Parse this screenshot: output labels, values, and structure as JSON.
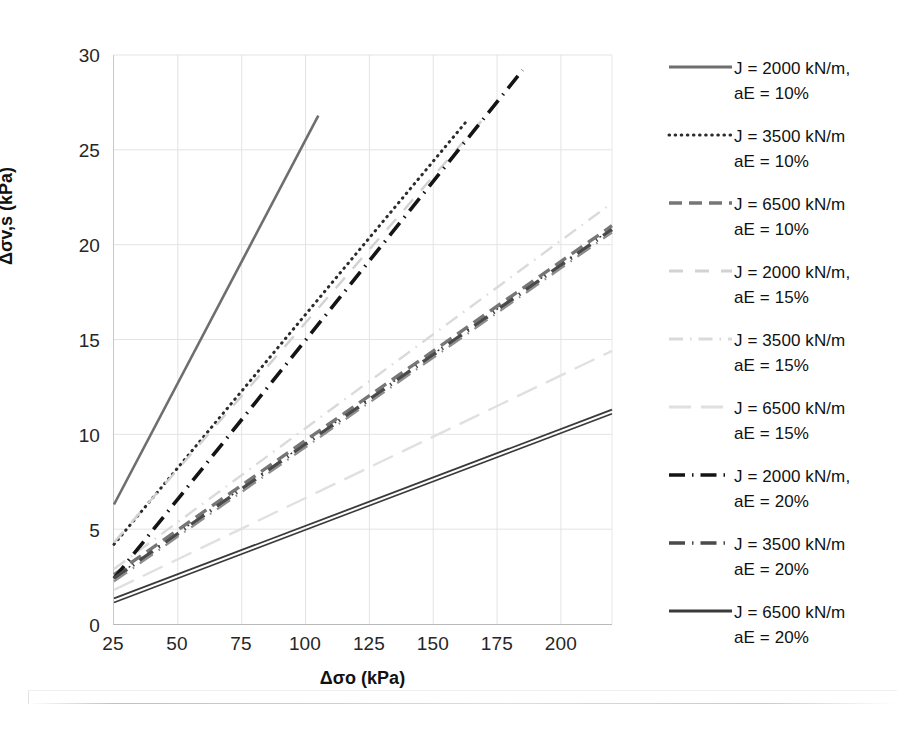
{
  "chart_data": {
    "type": "line",
    "title": "",
    "xlabel": "Δσo (kPa)",
    "ylabel": "Δσv,s (kPa)",
    "xlim": [
      25,
      220
    ],
    "ylim": [
      0,
      30
    ],
    "xticks": [
      25,
      50,
      75,
      100,
      125,
      150,
      175,
      200
    ],
    "yticks": [
      0,
      5,
      10,
      15,
      20,
      25,
      30
    ],
    "grid": true,
    "grid_color": "#e3e3e3",
    "legend_position": "right",
    "series": [
      {
        "name": "J = 2000 kN/m,\naE = 10%",
        "J": 2000,
        "aE": "10%",
        "style": "solid",
        "color": "#6e6e6e",
        "width": 2.6,
        "x": [
          25,
          105
        ],
        "y": [
          6.3,
          26.8
        ]
      },
      {
        "name": "J = 3500 kN/m\naE = 10%",
        "J": 3500,
        "aE": "10%",
        "style": "dotted",
        "color": "#2b2b2b",
        "width": 3.0,
        "x": [
          25,
          163
        ],
        "y": [
          4.2,
          26.5
        ]
      },
      {
        "name": "J = 6500 kN/m\naE = 10%",
        "J": 6500,
        "aE": "10%",
        "style": "dashed",
        "color": "#767676",
        "width": 3.4,
        "x": [
          25,
          220
        ],
        "y": [
          2.6,
          21.0
        ]
      },
      {
        "name": "J = 2000 kN/m,\naE = 15%",
        "J": 2000,
        "aE": "15%",
        "style": "dashed-light",
        "color": "#d2d2d2",
        "width": 2.4,
        "x": [
          25,
          172
        ],
        "y": [
          4.3,
          27.0
        ]
      },
      {
        "name": "J = 3500 kN/m\naE = 15%",
        "J": 3500,
        "aE": "15%",
        "style": "dashdot-light",
        "color": "#dadada",
        "width": 2.4,
        "x": [
          25,
          220
        ],
        "y": [
          2.9,
          22.2
        ]
      },
      {
        "name": "J = 6500 kN/m\naE = 15%",
        "J": 6500,
        "aE": "15%",
        "style": "longdash-light",
        "color": "#e0e0e0",
        "width": 2.4,
        "x": [
          25,
          220
        ],
        "y": [
          1.8,
          14.4
        ]
      },
      {
        "name": "J = 2000 kN/m,\naE = 20%",
        "J": 2000,
        "aE": "20%",
        "style": "dashdot",
        "color": "#141414",
        "width": 3.6,
        "x": [
          25,
          185
        ],
        "y": [
          2.4,
          29.2
        ]
      },
      {
        "name": "J = 3500 kN/m\naE = 20%",
        "J": 3500,
        "aE": "20%",
        "style": "dashdot-thick",
        "color": "#4a4a4a",
        "width": 3.6,
        "x": [
          25,
          220
        ],
        "y": [
          2.4,
          20.8
        ]
      },
      {
        "name": "J = 6500 kN/m\naE = 20%",
        "J": 6500,
        "aE": "20%",
        "style": "solid-thin",
        "color": "#3a3a3a",
        "width": 1.8,
        "x": [
          25,
          220
        ],
        "y": [
          1.35,
          11.3
        ]
      }
    ]
  },
  "axes": {
    "y_label": "Δσv,s (kPa)",
    "x_label": "Δσo (kPa)",
    "y_ticks": [
      "0",
      "5",
      "10",
      "15",
      "20",
      "25",
      "30"
    ],
    "x_ticks": [
      "25",
      "50",
      "75",
      "100",
      "125",
      "150",
      "175",
      "200"
    ]
  },
  "legend": {
    "items": [
      {
        "label": "J = 2000 kN/m,\naE = 10%",
        "key": "line-key-solid-gray"
      },
      {
        "label": "J = 3500 kN/m\naE = 10%",
        "key": "line-key-dotted"
      },
      {
        "label": "J = 6500 kN/m\naE = 10%",
        "key": "line-key-dashed"
      },
      {
        "label": "J = 2000 kN/m,\naE = 15%",
        "key": "line-key-dashed-light"
      },
      {
        "label": "J = 3500 kN/m\naE = 15%",
        "key": "line-key-dashdot-light"
      },
      {
        "label": "J = 6500 kN/m\naE = 15%",
        "key": "line-key-longdash-light"
      },
      {
        "label": "J = 2000 kN/m,\naE = 20%",
        "key": "line-key-dashdot-black"
      },
      {
        "label": "J = 3500 kN/m\naE = 20%",
        "key": "line-key-dashdot-thick"
      },
      {
        "label": "J = 6500 kN/m\naE = 20%",
        "key": "line-key-solid-black"
      }
    ]
  }
}
